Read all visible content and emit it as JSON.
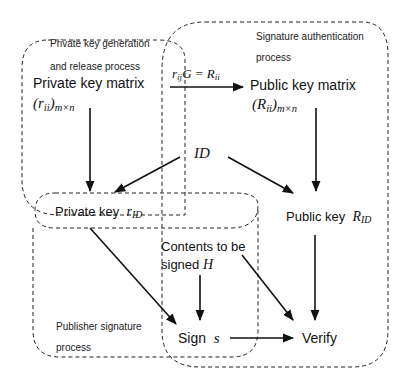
{
  "regions": {
    "private_gen": {
      "label_line1": "Private key generation",
      "label_line2": "and release process"
    },
    "sig_auth": {
      "label_line1": "Signature authentication",
      "label_line2": "process"
    },
    "publisher": {
      "label_line1": "Publisher  signature",
      "label_line2": "process"
    }
  },
  "nodes": {
    "private_matrix": {
      "title": "Private key matrix",
      "math": "(r",
      "math_sub": "ii",
      "math_close": ")",
      "math_dims": "m×n"
    },
    "public_matrix": {
      "title": "Public key matrix",
      "math": "(R",
      "math_sub": "ii",
      "math_close": ")",
      "math_dims": "m×n"
    },
    "equation": {
      "lhs": "r",
      "lhs_sub": "ij",
      "mid": "G = R",
      "rhs_sub": "ii"
    },
    "id": {
      "label": "ID"
    },
    "private_key": {
      "label": "Private key",
      "sym": "r",
      "sym_sub": "ID"
    },
    "public_key": {
      "label": "Public key",
      "sym": "R",
      "sym_sub": "ID"
    },
    "contents": {
      "line1": "Contents to be",
      "line2": "signed",
      "sym": "H"
    },
    "sign": {
      "label": "Sign",
      "sym": "s"
    },
    "verify": {
      "label": "Verify"
    }
  },
  "colors": {
    "line": "#111111",
    "dash": "#222222",
    "background": "#ffffff"
  }
}
